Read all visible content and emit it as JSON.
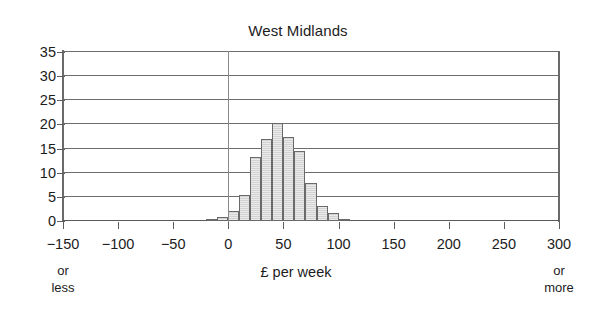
{
  "chart_data": {
    "type": "bar",
    "title": "West Midlands",
    "xlabel": "£ per week",
    "ylabel": "",
    "xlim": [
      -150,
      300
    ],
    "ylim": [
      0,
      35
    ],
    "grid": true,
    "legend": null,
    "xticks": [
      "−150",
      "−100",
      "−50",
      "0",
      "50",
      "100",
      "150",
      "200",
      "250",
      "300"
    ],
    "xtick_values": [
      -150,
      -100,
      -50,
      0,
      50,
      100,
      150,
      200,
      250,
      300
    ],
    "yticks": [
      "0",
      "5",
      "10",
      "15",
      "20",
      "25",
      "30",
      "35"
    ],
    "ytick_values": [
      0,
      5,
      10,
      15,
      20,
      25,
      30,
      35
    ],
    "annotations": {
      "left_axis_note": "or\nless",
      "left_axis_note_line1": "or",
      "left_axis_note_line2": "less",
      "right_axis_note_line1": "or",
      "right_axis_note_line2": "more"
    },
    "bin_width": 10,
    "bin_starts": [
      -20,
      -10,
      0,
      10,
      20,
      30,
      40,
      50,
      60,
      70,
      80,
      90,
      100
    ],
    "categories": [
      "-20",
      "-10",
      "0",
      "10",
      "20",
      "30",
      "40",
      "50",
      "60",
      "70",
      "80",
      "90",
      "100"
    ],
    "values": [
      0.3,
      0.8,
      2.1,
      5.3,
      13.2,
      17.0,
      20.3,
      17.3,
      14.6,
      7.8,
      3.2,
      1.6,
      0.4
    ],
    "bar_face_color": "#d2d2d2",
    "bar_edge_color": "#6a6a6a",
    "gridline_color": "#6e6e6e",
    "axis_color": "#6a6a6a",
    "text_color": "#1c1c1c",
    "background_color": "#ffffff"
  }
}
